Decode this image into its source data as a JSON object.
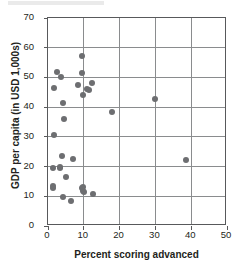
{
  "chart_data": {
    "type": "scatter",
    "title": "",
    "xlabel": "Percent scoring advanced",
    "ylabel": "GDP per capita (in USD 1,000s)",
    "xlim": [
      0,
      50
    ],
    "ylim": [
      0,
      70
    ],
    "xticks": [
      0,
      10,
      20,
      30,
      40,
      50
    ],
    "yticks": [
      0,
      10,
      20,
      30,
      40,
      50,
      60,
      70
    ],
    "xtick_labels": [
      "0",
      "10",
      "20",
      "30",
      "40",
      "50"
    ],
    "ytick_labels": [
      "0",
      "10",
      "20",
      "30",
      "40",
      "50",
      "60",
      "70"
    ],
    "grid": "both",
    "legend": "none",
    "marker_color": "#6d6e71",
    "marker_shape": "circle",
    "axis_color": "#58595b",
    "n_points": 31,
    "points": [
      {
        "x": 1.3,
        "y": 19.4
      },
      {
        "x": 1.4,
        "y": 12.8
      },
      {
        "x": 1.5,
        "y": 13.3
      },
      {
        "x": 1.6,
        "y": 30.6
      },
      {
        "x": 1.8,
        "y": 46.3
      },
      {
        "x": 2.6,
        "y": 51.7
      },
      {
        "x": 3.3,
        "y": 19.8
      },
      {
        "x": 3.4,
        "y": 19.6
      },
      {
        "x": 3.6,
        "y": 50.0
      },
      {
        "x": 3.9,
        "y": 23.4
      },
      {
        "x": 4.1,
        "y": 9.9
      },
      {
        "x": 4.3,
        "y": 41.4
      },
      {
        "x": 4.5,
        "y": 35.9
      },
      {
        "x": 4.9,
        "y": 16.5
      },
      {
        "x": 6.3,
        "y": 8.4
      },
      {
        "x": 7.0,
        "y": 22.4
      },
      {
        "x": 8.3,
        "y": 47.6
      },
      {
        "x": 9.4,
        "y": 57.3
      },
      {
        "x": 9.5,
        "y": 51.4
      },
      {
        "x": 9.6,
        "y": 12.9
      },
      {
        "x": 9.7,
        "y": 44.2
      },
      {
        "x": 9.8,
        "y": 13.0
      },
      {
        "x": 9.9,
        "y": 11.8
      },
      {
        "x": 10.1,
        "y": 11.5
      },
      {
        "x": 10.8,
        "y": 46.1
      },
      {
        "x": 11.4,
        "y": 45.9
      },
      {
        "x": 12.2,
        "y": 48.2
      },
      {
        "x": 12.6,
        "y": 10.7
      },
      {
        "x": 17.9,
        "y": 38.5
      },
      {
        "x": 29.9,
        "y": 42.9
      },
      {
        "x": 38.6,
        "y": 22.1
      }
    ]
  }
}
